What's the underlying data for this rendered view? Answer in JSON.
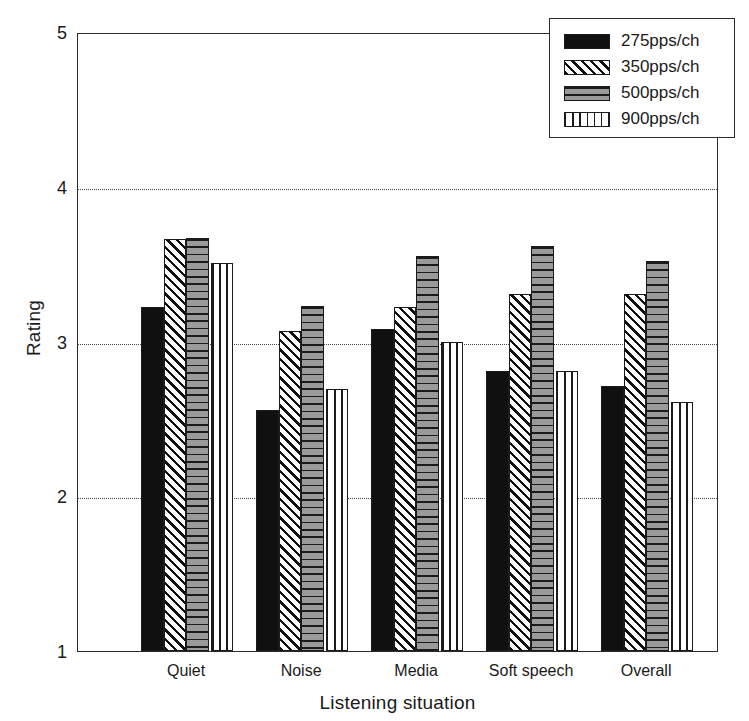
{
  "chart_data": {
    "type": "bar",
    "title": "",
    "xlabel": "Listening situation",
    "ylabel": "Rating",
    "categories": [
      "Quiet",
      "Noise",
      "Media",
      "Soft speech",
      "Overall"
    ],
    "series": [
      {
        "name": "275pps/ch",
        "pattern": "solid-black",
        "values": [
          3.22,
          2.56,
          3.08,
          2.81,
          2.71
        ]
      },
      {
        "name": "350pps/ch",
        "pattern": "diagonal-hatch",
        "values": [
          3.66,
          3.07,
          3.22,
          3.31,
          3.31
        ]
      },
      {
        "name": "500pps/ch",
        "pattern": "horizontal-lines",
        "values": [
          3.67,
          3.23,
          3.55,
          3.62,
          3.52
        ]
      },
      {
        "name": "900pps/ch",
        "pattern": "vertical-lines",
        "values": [
          3.51,
          2.69,
          3.0,
          2.81,
          2.61
        ]
      }
    ],
    "ylim": [
      1,
      5
    ],
    "yticks": [
      1,
      2,
      3,
      4,
      5
    ],
    "ytick_labels": [
      "1",
      "2",
      "3",
      "4",
      "5"
    ],
    "gridlines_at": [
      2,
      3,
      4
    ],
    "grid": "horizontal-dotted",
    "legend_position": "top-right",
    "legend_entries": [
      "275pps/ch",
      "350pps/ch",
      "500pps/ch",
      "900pps/ch"
    ],
    "colors": {
      "axis": "#2b2b2b",
      "grid": "#4a4a4a",
      "series_275": "#101010",
      "series_350": "#d8d8d8",
      "series_500": "#8e8e8e",
      "series_900": "#ffffff",
      "background": "#ffffff"
    }
  }
}
